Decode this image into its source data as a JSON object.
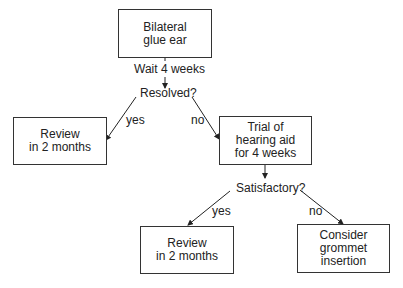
{
  "nodes": {
    "start": "Bilateral\nglue ear",
    "wait": "Wait 4 weeks",
    "resolved": "Resolved?",
    "review1": "Review\nin 2 months",
    "trial": "Trial of\nhearing aid\nfor 4 weeks",
    "satisfactory": "Satisfactory?",
    "review2": "Review\nin 2 months",
    "grommet": "Consider\ngrommet\ninsertion"
  },
  "edges": {
    "resolved_yes": "yes",
    "resolved_no": "no",
    "satisfactory_yes": "yes",
    "satisfactory_no": "no"
  }
}
